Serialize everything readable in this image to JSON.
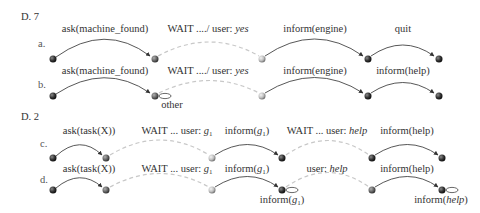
{
  "sections": [
    {
      "title": "D. 7",
      "rows": [
        {
          "label": "a.",
          "edges": [
            {
              "type": "solid",
              "text": "ask(machine_found)"
            },
            {
              "type": "dashed",
              "text_plain": "WAIT ..../ user: ",
              "text_italic": "yes"
            },
            {
              "type": "solid",
              "text": "inform(engine)"
            },
            {
              "type": "solid",
              "text": "quit"
            }
          ]
        },
        {
          "label": "b.",
          "edges": [
            {
              "type": "solid",
              "text": "ask(machine_found)"
            },
            {
              "type": "dashed",
              "text_plain": "WAIT ..../ user: ",
              "text_italic": "yes"
            },
            {
              "type": "solid",
              "text": "inform(engine)"
            },
            {
              "type": "solid",
              "text": "inform(help)"
            }
          ],
          "self_loops": [
            {
              "node": 2,
              "text": "other"
            }
          ]
        }
      ]
    },
    {
      "title": "D. 2",
      "rows": [
        {
          "label": "c.",
          "edges": [
            {
              "type": "solid",
              "text": "ask(task(X))"
            },
            {
              "type": "dashed",
              "text_plain": "WAIT ... user: ",
              "text_italic": "g",
              "sub": "1"
            },
            {
              "type": "solid",
              "text_plain": "inform(",
              "text_italic": "g",
              "sub": "1",
              "close": ")"
            },
            {
              "type": "dashed",
              "text_plain": "WAIT ... user: ",
              "text_italic": "help"
            },
            {
              "type": "solid",
              "text": "inform(help)"
            }
          ]
        },
        {
          "label": "d.",
          "edges": [
            {
              "type": "solid",
              "text": "ask(task(X))"
            },
            {
              "type": "dashed",
              "text_plain": "WAIT ... user: ",
              "text_italic": "g",
              "sub": "1"
            },
            {
              "type": "solid",
              "text_plain": "inform(",
              "text_italic": "g",
              "sub": "1",
              "close": ")"
            },
            {
              "type": "dashed",
              "text_plain": "user: ",
              "text_italic": "help"
            },
            {
              "type": "solid",
              "text": "inform(help)"
            }
          ],
          "self_loops": [
            {
              "node": 4,
              "text_plain": "inform(",
              "text_italic": "g",
              "sub": "1",
              "close": ")"
            },
            {
              "node": 6,
              "text_plain": "inform(",
              "text_italic": "help",
              "close": ")"
            }
          ]
        }
      ]
    }
  ],
  "colors": {
    "node_dark": "#2e2e2e",
    "node_mid": "#6a6a6a",
    "node_light": "#c4c4c4",
    "solid_edge": "#444444",
    "dashed_edge": "#c8c8c8"
  }
}
